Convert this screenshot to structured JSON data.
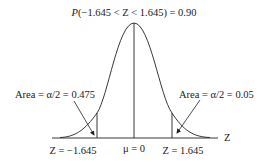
{
  "diagram": {
    "title": "P(−1.645 < Z < 1.645) = 0.90",
    "title_italic_prefix": "P",
    "title_rest": "(−1.645 < Z < 1.645) = 0.90",
    "left_area_label": "Area = α/2 = 0.475",
    "right_area_label": "Area = α/2 = 0.05",
    "axis_label": "Z",
    "left_z_label": "Z = −1.645",
    "center_label": "μ = 0",
    "right_z_label": "Z = 1.645",
    "colors": {
      "line": "#222222",
      "background": "#ffffff"
    }
  }
}
